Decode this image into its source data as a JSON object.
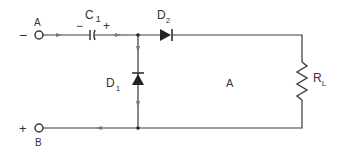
{
  "diagram": {
    "type": "circuit-schematic",
    "colors": {
      "wire": "#3a3a3a",
      "arrow": "#777777",
      "background": "#ffffff"
    },
    "terminals": {
      "a": {
        "label": "A",
        "polarity": "−"
      },
      "b": {
        "label": "B",
        "polarity": "+"
      }
    },
    "components": {
      "capacitor": {
        "label": "C",
        "subscript": "1",
        "neg": "−",
        "pos": "+"
      },
      "diode_series": {
        "label": "D",
        "subscript": "2"
      },
      "diode_shunt": {
        "label": "D",
        "subscript": "1"
      },
      "load_resistor": {
        "label": "R",
        "subscript": "L"
      }
    },
    "region_label": "A"
  }
}
